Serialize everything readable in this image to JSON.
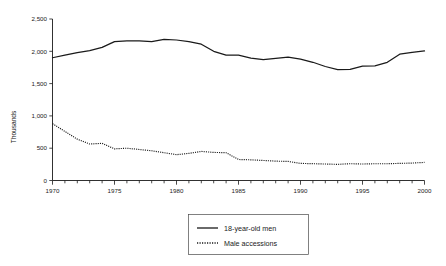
{
  "chart_data": {
    "type": "line",
    "title": "",
    "xlabel": "",
    "ylabel": "Thousands",
    "xlim": [
      1970,
      2000
    ],
    "ylim": [
      0,
      2500
    ],
    "grid": false,
    "legend_position": "bottom-center",
    "x_ticks_major": [
      "1970",
      "1975",
      "1980",
      "1985",
      "1990",
      "1995",
      "2000"
    ],
    "x_ticks_major_values": [
      1970,
      1975,
      1980,
      1985,
      1990,
      1995,
      2000
    ],
    "x_ticks_minor_step": 1,
    "y_ticks": [
      "0",
      "500",
      "1,000",
      "1,500",
      "2,000",
      "2,500"
    ],
    "y_tick_values": [
      0,
      500,
      1000,
      1500,
      2000,
      2500
    ],
    "x": [
      1970,
      1971,
      1972,
      1973,
      1974,
      1975,
      1976,
      1977,
      1978,
      1979,
      1980,
      1981,
      1982,
      1983,
      1984,
      1985,
      1986,
      1987,
      1988,
      1989,
      1990,
      1991,
      1992,
      1993,
      1994,
      1995,
      1996,
      1997,
      1998,
      1999,
      2000
    ],
    "series": [
      {
        "name": "18-year-old men",
        "style": "solid",
        "color": "#1a1a1a",
        "values": [
          1900,
          1940,
          1980,
          2010,
          2060,
          2150,
          2160,
          2160,
          2150,
          2185,
          2175,
          2150,
          2110,
          2000,
          1940,
          1940,
          1895,
          1870,
          1890,
          1910,
          1880,
          1830,
          1765,
          1715,
          1720,
          1770,
          1775,
          1830,
          1955,
          1985,
          2005
        ]
      },
      {
        "name": "Male accessions",
        "style": "dotted",
        "color": "#1a1a1a",
        "values": [
          880,
          760,
          640,
          565,
          575,
          490,
          500,
          480,
          460,
          430,
          400,
          420,
          450,
          435,
          430,
          325,
          320,
          310,
          300,
          295,
          265,
          260,
          255,
          250,
          260,
          255,
          260,
          260,
          265,
          270,
          280
        ]
      }
    ]
  },
  "legend": {
    "items": [
      {
        "label": "18-year-old men",
        "style": "solid"
      },
      {
        "label": "Male accessions",
        "style": "dotted"
      }
    ]
  }
}
